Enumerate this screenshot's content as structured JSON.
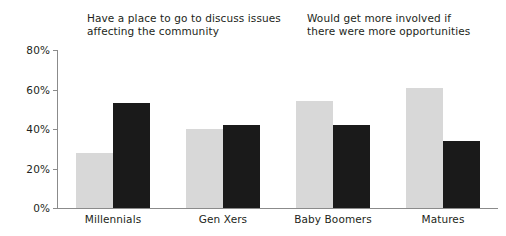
{
  "chart_data": {
    "type": "bar",
    "title": "",
    "subtitle": "",
    "xlabel": "",
    "ylabel": "",
    "categories": [
      "Millennials",
      "Gen Xers",
      "Baby Boomers",
      "Matures"
    ],
    "series": [
      {
        "name": "Have a place to go to discuss issues affecting the community",
        "color": "#d8d8d8",
        "values": [
          28,
          40,
          54,
          61
        ]
      },
      {
        "name": "Would get more involved if there were more opportunities",
        "color": "#1a1a1a",
        "values": [
          53,
          42,
          42,
          34
        ]
      }
    ],
    "ylim": [
      0,
      80
    ],
    "ytick_values": [
      0,
      20,
      40,
      60,
      80
    ],
    "ytick_labels": [
      "0%",
      "20%",
      "40%",
      "60%",
      "80%"
    ],
    "grid": false,
    "legend_position": "top",
    "axis_color": "#8b8b8b",
    "text_color": "#231f20",
    "background": "#ffffff"
  },
  "legend": {
    "items": [
      {
        "label": "Have a place to go to discuss issues\naffecting the community",
        "color": "#d8d8d8"
      },
      {
        "label": "Would get more involved if\nthere were more opportunities",
        "color": "#1a1a1a"
      }
    ]
  }
}
